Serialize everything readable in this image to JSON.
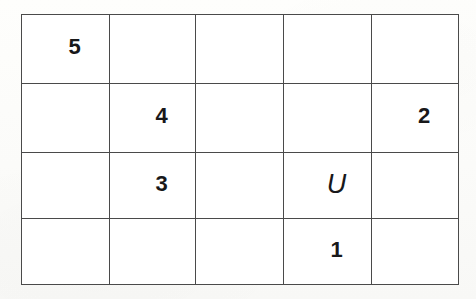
{
  "diagram": {
    "type": "grid-table",
    "columns": 5,
    "rows": 4,
    "colors": {
      "page_background": "#fdfdfb",
      "cell_background": "#ffffff",
      "shaded_cell_background": "#e9e9e9",
      "grid_line": "#4a4a4a",
      "label_text": "#18181a"
    },
    "legend": {
      "shaded_meaning": "stippled cross-hatch fill",
      "unshaded_meaning": "plain white fill"
    },
    "cells": [
      [
        {
          "label": "5",
          "shaded": true,
          "kind": "digit"
        },
        {
          "label": "",
          "shaded": false,
          "kind": "empty"
        },
        {
          "label": "",
          "shaded": false,
          "kind": "empty"
        },
        {
          "label": "",
          "shaded": false,
          "kind": "empty"
        },
        {
          "label": "",
          "shaded": false,
          "kind": "empty"
        }
      ],
      [
        {
          "label": "",
          "shaded": false,
          "kind": "empty"
        },
        {
          "label": "4",
          "shaded": true,
          "kind": "digit"
        },
        {
          "label": "",
          "shaded": false,
          "kind": "empty"
        },
        {
          "label": "",
          "shaded": false,
          "kind": "empty"
        },
        {
          "label": "2",
          "shaded": true,
          "kind": "digit"
        }
      ],
      [
        {
          "label": "",
          "shaded": false,
          "kind": "empty"
        },
        {
          "label": "3",
          "shaded": true,
          "kind": "digit"
        },
        {
          "label": "",
          "shaded": false,
          "kind": "empty"
        },
        {
          "label": "U",
          "shaded": false,
          "kind": "letter"
        },
        {
          "label": "",
          "shaded": false,
          "kind": "empty"
        }
      ],
      [
        {
          "label": "",
          "shaded": false,
          "kind": "empty"
        },
        {
          "label": "",
          "shaded": false,
          "kind": "empty"
        },
        {
          "label": "",
          "shaded": false,
          "kind": "empty"
        },
        {
          "label": "1",
          "shaded": true,
          "kind": "digit"
        },
        {
          "label": "",
          "shaded": false,
          "kind": "empty"
        }
      ]
    ]
  }
}
